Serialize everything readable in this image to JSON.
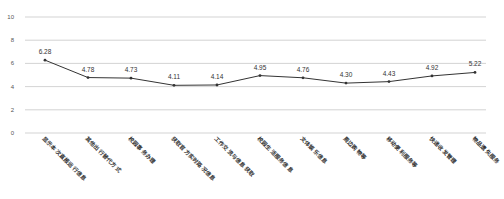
{
  "chart_data": {
    "type": "line",
    "title": "",
    "xlabel": "",
    "ylabel": "",
    "ylim": [
      0,
      10
    ],
    "yticks": [
      0,
      2,
      4,
      6,
      8,
      10
    ],
    "grid": true,
    "legend": null,
    "categories": [
      "显示本次直报运行信息",
      "其他出行替代方式",
      "校园事务办理",
      "获取官方实时路况信息",
      "工作交流与信息获取",
      "校园生活服务信息",
      "文体娱乐信息",
      "周边购物等",
      "移动便利服务等",
      "快递收发管理",
      "物品遗失服务"
    ],
    "values": [
      6.28,
      4.78,
      4.73,
      4.11,
      4.14,
      4.95,
      4.76,
      4.3,
      4.43,
      4.92,
      5.22
    ],
    "data_labels": [
      "6.28",
      "4.78",
      "4.73",
      "4.11",
      "4.14",
      "4.95",
      "4.76",
      "4.30",
      "4.43",
      "4.92",
      "5.22"
    ]
  },
  "style": {
    "line_color": "#333333",
    "grid_color": "#c8c8c8",
    "text_color": "#555555"
  }
}
